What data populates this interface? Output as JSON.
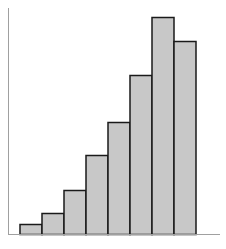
{
  "chart_data": {
    "type": "bar",
    "title": "",
    "xlabel": "",
    "ylabel": "",
    "categories": [
      "1",
      "2",
      "3",
      "4",
      "5",
      "6",
      "7",
      "8"
    ],
    "values": [
      10,
      21,
      44,
      79,
      112,
      159,
      217,
      193
    ],
    "ylim": [
      0,
      226
    ],
    "grid": false,
    "legend": null,
    "tick_labels_visible": false,
    "colors": {
      "bar_fill": "#c8c8c8",
      "bar_edge": "#1a1a1a",
      "axis": "#a0a0a0",
      "background": "#ffffff"
    }
  }
}
